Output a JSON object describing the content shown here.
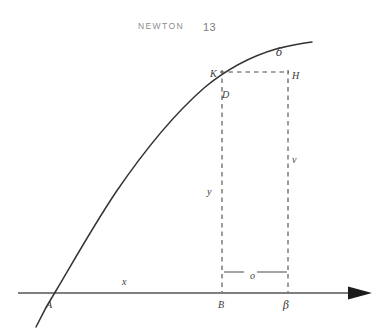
{
  "header": {
    "title": "NEWTON",
    "page_number": "13"
  },
  "figure": {
    "name": "newton-fluxion-curve-diagram",
    "colors": {
      "ink": "#3a3a3a",
      "axis": "#555555",
      "curve": "#333333",
      "dash": "#4a4a4a",
      "header_text": "#8d8d8d",
      "background": "#ffffff"
    },
    "labels": [
      {
        "id": "delta",
        "text": "δ",
        "x": 276,
        "y": 47,
        "kind": "greek",
        "desc": "curve-end-label-delta"
      },
      {
        "id": "K",
        "text": "K",
        "x": 210,
        "y": 69,
        "kind": "latin",
        "desc": "point-label-k"
      },
      {
        "id": "H",
        "text": "H",
        "x": 292,
        "y": 71,
        "kind": "latin",
        "desc": "point-label-h"
      },
      {
        "id": "D",
        "text": "D",
        "x": 222,
        "y": 90,
        "kind": "latin",
        "desc": "point-label-d"
      },
      {
        "id": "v",
        "text": "v",
        "x": 292,
        "y": 155,
        "kind": "latin",
        "desc": "ordinate-label-v"
      },
      {
        "id": "y",
        "text": "y",
        "x": 207,
        "y": 187,
        "kind": "latin",
        "desc": "ordinate-label-y"
      },
      {
        "id": "x",
        "text": "x",
        "x": 122,
        "y": 277,
        "kind": "latin",
        "desc": "abscissa-label-x"
      },
      {
        "id": "o",
        "text": "o",
        "x": 250,
        "y": 271,
        "kind": "latin",
        "desc": "increment-label-o"
      },
      {
        "id": "A",
        "text": "A",
        "x": 46,
        "y": 300,
        "kind": "latin",
        "desc": "point-label-a"
      },
      {
        "id": "B",
        "text": "B",
        "x": 218,
        "y": 300,
        "kind": "latin",
        "desc": "point-label-b"
      },
      {
        "id": "beta",
        "text": "β",
        "x": 283,
        "y": 300,
        "kind": "greek",
        "desc": "point-label-beta"
      }
    ],
    "geometry": {
      "axis_y": 293,
      "axis_x_start": 18,
      "axis_x_end": 370,
      "curve_crossing_x": 55,
      "ordinate_B_x": 222,
      "ordinate_beta_x": 288,
      "chord_y": 72,
      "increment_bracket_y": 272
    }
  }
}
